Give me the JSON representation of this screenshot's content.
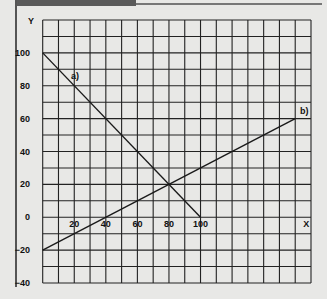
{
  "chart_data": {
    "type": "line",
    "title": "",
    "xlabel": "X",
    "ylabel": "Y",
    "xlim": [
      0,
      170
    ],
    "ylim": [
      -40,
      120
    ],
    "grid": true,
    "x_ticks": [
      "20",
      "40",
      "60",
      "80",
      "100"
    ],
    "y_ticks": [
      "100",
      "80",
      "60",
      "40",
      "20",
      "0",
      "−20",
      "−40"
    ],
    "series": [
      {
        "name": "a)",
        "x": [
          0,
          100
        ],
        "y": [
          100,
          0
        ]
      },
      {
        "name": "b)",
        "x": [
          0,
          160
        ],
        "y": [
          -20,
          60
        ]
      }
    ],
    "annotations": [
      {
        "text": "a)",
        "x": 18,
        "y": 84
      },
      {
        "text": "b)",
        "x": 163,
        "y": 63
      }
    ]
  },
  "colors": {
    "background": "#e8e8e6",
    "grid": "#222222",
    "line": "#1a1a1a",
    "tab": "#5a5a5a"
  }
}
